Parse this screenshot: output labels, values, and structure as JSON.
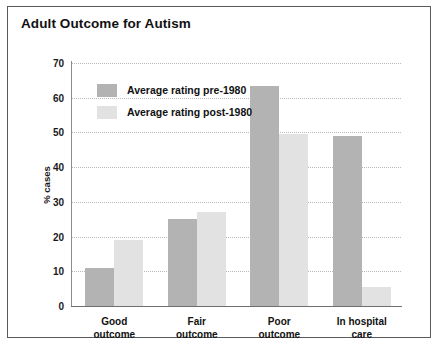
{
  "figure": {
    "title": "Adult Outcome for Autism"
  },
  "chart_data": {
    "type": "bar",
    "title": "Adult Outcome for Autism",
    "xlabel": "",
    "ylabel": "% cases",
    "ylim": [
      0,
      70
    ],
    "yticks": [
      0,
      10,
      20,
      30,
      40,
      50,
      60,
      70
    ],
    "grid": true,
    "legend_position": "inside top-left",
    "categories": [
      "Good\noutcome",
      "Fair\noutcome",
      "Poor\noutcome",
      "In hospital\ncare"
    ],
    "category_lines": [
      [
        "Good",
        "outcome"
      ],
      [
        "Fair",
        "outcome"
      ],
      [
        "Poor",
        "outcome"
      ],
      [
        "In hospital",
        "care"
      ]
    ],
    "series": [
      {
        "name": "Average rating pre-1980",
        "color": "#b3b3b3",
        "values": [
          11,
          25,
          63.5,
          49
        ]
      },
      {
        "name": "Average rating post-1980",
        "color": "#e2e2e2",
        "values": [
          19,
          27,
          49.5,
          5.5
        ]
      }
    ]
  },
  "colors": {
    "pre_1980": "#b3b3b3",
    "post_1980": "#e2e2e2",
    "border": "#5a5a5a",
    "gridline": "#b9b9b9",
    "text": "#111111"
  }
}
